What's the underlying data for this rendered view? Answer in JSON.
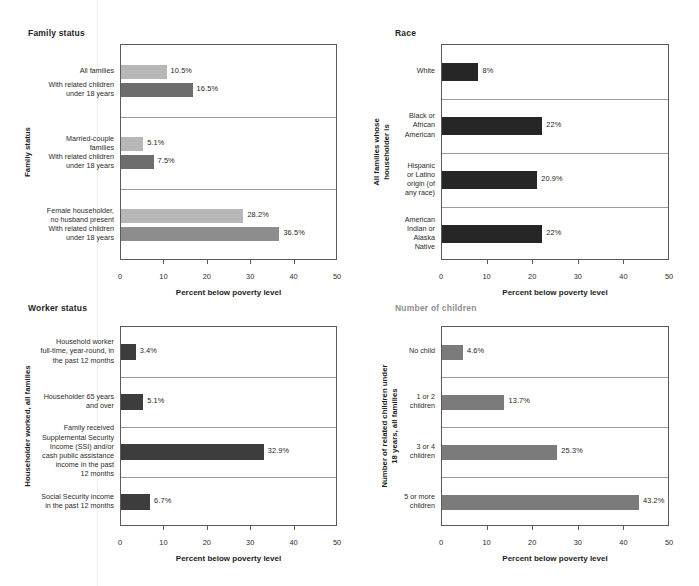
{
  "chart_data": [
    {
      "id": "family-status",
      "type": "bar",
      "orientation": "horizontal",
      "title": "Family status",
      "title_color": "#1d1d1d",
      "ylabel": "Family status",
      "xlabel": "Percent below poverty level",
      "xlim": [
        0,
        50
      ],
      "xticks": [
        0,
        10,
        20,
        30,
        40,
        50
      ],
      "grid": false,
      "group_separators": true,
      "categories": [
        "All families",
        "With related children\nunder 18 years",
        "Married-couple\nfamilies",
        "With related children\nunder 18 years",
        "Female householder,\nno husband present",
        "With related children\nunder 18 years"
      ],
      "values": [
        10.5,
        16.5,
        5.1,
        7.5,
        28.2,
        36.5
      ],
      "labels": [
        "10.5%",
        "16.5%",
        "5.1%",
        "7.5%",
        "28.2%",
        "36.5%"
      ],
      "colors": [
        "#b7b7b7",
        "#6d6d6d",
        "#b7b7b7",
        "#6d6d6d",
        "#b7b7b7",
        "#8d8d8d"
      ]
    },
    {
      "id": "race",
      "type": "bar",
      "orientation": "horizontal",
      "title": "Race",
      "title_color": "#1d1d1d",
      "ylabel": "All families whose\nhouseholder is",
      "xlabel": "Percent below poverty level",
      "xlim": [
        0,
        50
      ],
      "xticks": [
        0,
        10,
        20,
        30,
        40,
        50
      ],
      "grid": false,
      "group_separators": true,
      "categories": [
        "White",
        "Black or\nAfrican\nAmerican",
        "Hispanic\nor Latino\norigin (of\nany race)",
        "American\nIndian or\nAlaska\nNative"
      ],
      "values": [
        8,
        22,
        20.9,
        22
      ],
      "labels": [
        "8%",
        "22%",
        "20.9%",
        "22%"
      ],
      "colors": [
        "#262626",
        "#262626",
        "#262626",
        "#262626"
      ]
    },
    {
      "id": "worker-status",
      "type": "bar",
      "orientation": "horizontal",
      "title": "Worker status",
      "title_color": "#1d1d1d",
      "ylabel": "Householder worked, all families",
      "xlabel": "Percent below poverty level",
      "xlim": [
        0,
        50
      ],
      "xticks": [
        0,
        10,
        20,
        30,
        40,
        50
      ],
      "grid": false,
      "group_separators": true,
      "categories": [
        "Household worker\nfull-time, year-round, in\nthe past 12 months",
        "Householder 65 years\nand over",
        "Family received\nSupplemental Security\nIncome (SSI) and/or\ncash public assistance\nincome in the past\n12 months",
        "Social Security income\nin the past 12 months"
      ],
      "values": [
        3.4,
        5.1,
        32.9,
        6.7
      ],
      "labels": [
        "3.4%",
        "5.1%",
        "32.9%",
        "6.7%"
      ],
      "colors": [
        "#3d3d3d",
        "#3d3d3d",
        "#3d3d3d",
        "#3d3d3d"
      ]
    },
    {
      "id": "number-of-children",
      "type": "bar",
      "orientation": "horizontal",
      "title": "Number of children",
      "title_color": "#8f8f8f",
      "ylabel": "Number of related children under\n18 years, all families",
      "xlabel": "Percent below poverty level",
      "xlim": [
        0,
        50
      ],
      "xticks": [
        0,
        10,
        20,
        30,
        40,
        50
      ],
      "grid": false,
      "group_separators": true,
      "categories": [
        "No child",
        "1 or 2\nchildren",
        "3 or 4\nchildren",
        "5 or more\nchildren"
      ],
      "values": [
        4.6,
        13.7,
        25.3,
        43.2
      ],
      "labels": [
        "4.6%",
        "13.7%",
        "25.3%",
        "43.2%"
      ],
      "colors": [
        "#7b7b7b",
        "#7b7b7b",
        "#7b7b7b",
        "#7b7b7b"
      ]
    }
  ]
}
